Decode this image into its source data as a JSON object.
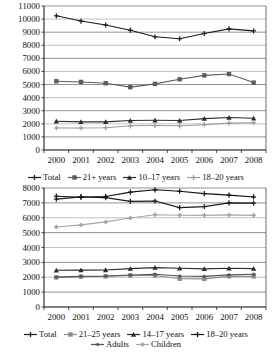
{
  "chart_data": [
    {
      "type": "line",
      "title": "",
      "xlabel": "",
      "ylabel": "",
      "grid": true,
      "legend_position": "bottom",
      "categories": [
        "2000",
        "2001",
        "2002",
        "2003",
        "2004",
        "2005",
        "2006",
        "2007",
        "2008"
      ],
      "ylim": [
        0,
        11000
      ],
      "ytick_step": 1000,
      "yticks": [
        "0",
        "1000",
        "2000",
        "3000",
        "4000",
        "5000",
        "6000",
        "7000",
        "8000",
        "9000",
        "10000",
        "11000"
      ],
      "series": [
        {
          "name": "Total",
          "marker": "cross",
          "color": "#1a1a1a",
          "values": [
            10250,
            9850,
            9550,
            9150,
            8650,
            8500,
            8900,
            9250,
            9100
          ]
        },
        {
          "name": "21+ years",
          "marker": "square",
          "color": "#5c5c5c",
          "values": [
            5250,
            5200,
            5100,
            4800,
            5050,
            5400,
            5700,
            5800,
            5150
          ]
        },
        {
          "name": "10–17 years",
          "marker": "triangle",
          "color": "#2b2b2b",
          "values": [
            2200,
            2150,
            2150,
            2250,
            2270,
            2250,
            2400,
            2480,
            2420
          ]
        },
        {
          "name": "18–20 years",
          "marker": "cross",
          "color": "#9a9a9a",
          "values": [
            1680,
            1680,
            1700,
            1850,
            1870,
            1850,
            1930,
            2050,
            2080
          ]
        }
      ]
    },
    {
      "type": "line",
      "title": "",
      "xlabel": "",
      "ylabel": "",
      "grid": true,
      "legend_position": "bottom",
      "categories": [
        "2000",
        "2001",
        "2002",
        "2003",
        "2004",
        "2005",
        "2006",
        "2007",
        "2008"
      ],
      "ylim": [
        0,
        8000
      ],
      "ytick_step": 1000,
      "yticks": [
        "0",
        "1000",
        "2000",
        "3000",
        "4000",
        "5000",
        "6000",
        "7000",
        "8000"
      ],
      "series": [
        {
          "name": "Total",
          "marker": "cross",
          "color": "#1a1a1a",
          "values": [
            7250,
            7400,
            7350,
            7100,
            7120,
            6680,
            6750,
            7000,
            6980
          ]
        },
        {
          "name": "21–25 years",
          "marker": "square",
          "color": "#8c8c8c",
          "values": [
            1990,
            2040,
            2060,
            2120,
            2120,
            1900,
            1890,
            2060,
            2060
          ]
        },
        {
          "name": "14–17 years",
          "marker": "triangle",
          "color": "#2b2b2b",
          "values": [
            2470,
            2480,
            2490,
            2580,
            2650,
            2600,
            2560,
            2600,
            2580
          ]
        },
        {
          "name": "18–20 years",
          "marker": "cross",
          "color": "#111111",
          "values": [
            7450,
            7380,
            7430,
            7720,
            7880,
            7780,
            7620,
            7520,
            7400
          ]
        },
        {
          "name": "Adults",
          "marker": "cross-sm",
          "color": "#555555",
          "values": [
            2010,
            2060,
            2080,
            2150,
            2200,
            2080,
            2060,
            2160,
            2200
          ]
        },
        {
          "name": "Children",
          "marker": "diamond",
          "color": "#a6a6a6",
          "values": [
            5380,
            5520,
            5720,
            5980,
            6200,
            6170,
            6160,
            6190,
            6160
          ]
        }
      ]
    }
  ],
  "legends": {
    "chart1": [
      {
        "label": "Total"
      },
      {
        "label": "21+ years"
      },
      {
        "label": "10–17 years"
      },
      {
        "label": "18–20 years"
      }
    ],
    "chart2": [
      {
        "label": "Total"
      },
      {
        "label": "21–25 years"
      },
      {
        "label": "14–17 years"
      },
      {
        "label": "18–20 years"
      },
      {
        "label": "Adults"
      },
      {
        "label": "Children"
      }
    ]
  }
}
